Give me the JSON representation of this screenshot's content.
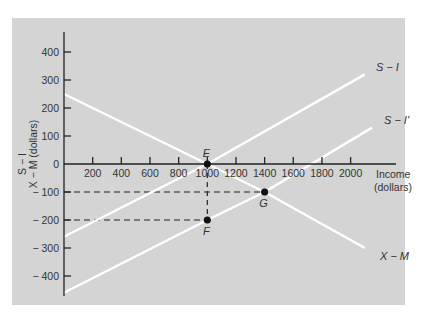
{
  "chart_data": {
    "type": "line",
    "title": "",
    "xlabel": "Income (dollars)",
    "xlabel_lines": [
      "Income",
      "(dollars)"
    ],
    "ylabel": "S − I, X − M (dollars)",
    "ylabel_lines": [
      "S − I",
      "X − M (dollars)"
    ],
    "xlim": [
      0,
      2200
    ],
    "ylim": [
      -470,
      470
    ],
    "x_ticks": [
      200,
      400,
      600,
      800,
      1000,
      1200,
      1400,
      1600,
      1800,
      2000
    ],
    "x_tick_labels": [
      "200",
      "400",
      "600",
      "800",
      "1000",
      "1200",
      "1400",
      "1600",
      "1800",
      "2000"
    ],
    "y_ticks": [
      400,
      300,
      200,
      100,
      0,
      -100,
      -200,
      -300,
      -400
    ],
    "y_tick_labels": [
      "400",
      "300",
      "200",
      "100",
      "0",
      "-100",
      "-200",
      "-300",
      "-400"
    ],
    "grid": false,
    "legend": "none (curves labeled directly)",
    "background_color": "#d4d4d4",
    "line_color": "#ffffff",
    "series": [
      {
        "name": "X − M",
        "label": "X − M",
        "x": [
          0,
          1000,
          1400,
          2100
        ],
        "y": [
          250,
          0,
          -100,
          -300
        ]
      },
      {
        "name": "S − I",
        "label": "S − I",
        "x": [
          0,
          1000,
          2100
        ],
        "y": [
          -260,
          0,
          320
        ]
      },
      {
        "name": "S − I'",
        "label": "S − I'",
        "x": [
          0,
          1000,
          1400,
          2150
        ],
        "y": [
          -460,
          -200,
          -100,
          130
        ]
      }
    ],
    "points": [
      {
        "label": "E",
        "x": 1000,
        "y": 0
      },
      {
        "label": "F",
        "x": 1000,
        "y": -200
      },
      {
        "label": "G",
        "x": 1400,
        "y": -100
      }
    ],
    "guides": [
      {
        "type": "dashed-horizontal",
        "y": -100,
        "x_from": 0,
        "x_to": 1400
      },
      {
        "type": "dashed-horizontal",
        "y": -200,
        "x_from": 0,
        "x_to": 1000
      },
      {
        "type": "dashed-vertical",
        "x": 1000,
        "y_from": 0,
        "y_to": -200
      }
    ]
  }
}
